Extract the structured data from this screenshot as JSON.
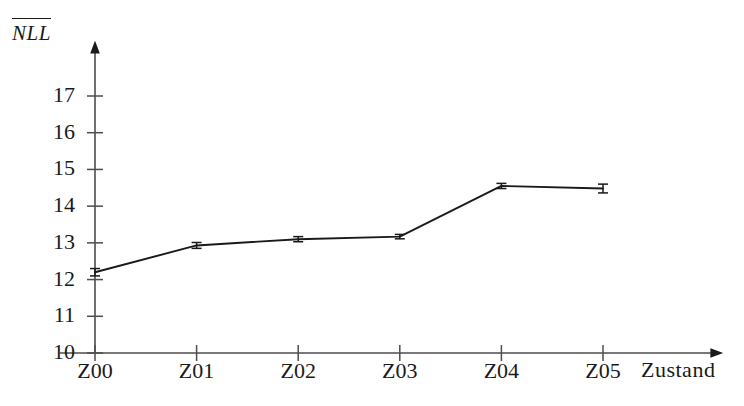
{
  "chart_data": {
    "type": "line",
    "title": "",
    "subtitle": "",
    "xlabel": "Zustand",
    "ylabel": "NLL",
    "ylabel_style": "overline",
    "categories": [
      "Z00",
      "Z01",
      "Z02",
      "Z03",
      "Z04",
      "Z05"
    ],
    "values": [
      12.2,
      12.93,
      13.1,
      13.17,
      14.55,
      14.48
    ],
    "errors": [
      0.1,
      0.08,
      0.07,
      0.06,
      0.07,
      0.12
    ],
    "series": [
      {
        "name": "NLL",
        "values": [
          12.2,
          12.93,
          13.1,
          13.17,
          14.55,
          14.48
        ],
        "errors": [
          0.1,
          0.08,
          0.07,
          0.06,
          0.07,
          0.12
        ]
      }
    ],
    "ylim": [
      10,
      17.6
    ],
    "yticks": [
      10,
      11,
      12,
      13,
      14,
      15,
      16,
      17
    ],
    "ytick_labels": [
      "10",
      "11",
      "12",
      "13",
      "14",
      "15",
      "16",
      "17"
    ],
    "xticks": [
      "Z00",
      "Z01",
      "Z02",
      "Z03",
      "Z04",
      "Z05"
    ],
    "grid": false,
    "legend": false,
    "legend_position": "none",
    "line_color": "#1a1a1a",
    "axis_color": "#4d4d4d",
    "background_color": "#ffffff",
    "axis_arrows": true,
    "marker": "error-bar-cap"
  },
  "axis": {
    "y_title": "NLL",
    "x_title": "Zustand"
  },
  "colors": {
    "line": "#1a1a1a",
    "axis": "#4d4d4d",
    "text": "#1a1a1a",
    "background": "#ffffff"
  }
}
